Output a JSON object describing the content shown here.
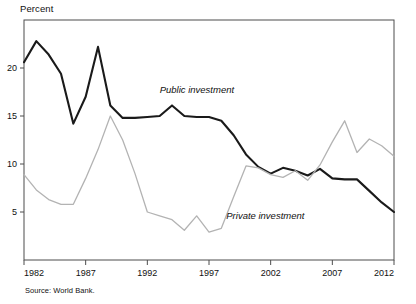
{
  "figure": {
    "y_axis_title": "Percent",
    "source": "Source: World Bank.",
    "label_public": "Public investment",
    "label_private": "Private investment",
    "color_public": "#1a1a1a",
    "color_private": "#b3b3b3",
    "frame_color": "#4d4d4d"
  },
  "chart_data": {
    "type": "line",
    "title": "",
    "xlabel": "",
    "ylabel": "Percent",
    "xlim": [
      1982,
      2012
    ],
    "ylim": [
      0,
      25
    ],
    "xticks": [
      1982,
      1987,
      1992,
      1997,
      2002,
      2007,
      2012
    ],
    "yticks": [
      5,
      10,
      15,
      20
    ],
    "ytick_labels": [
      "5",
      "10",
      "15",
      "20"
    ],
    "xtick_labels": [
      "1982",
      "1987",
      "1992",
      "1997",
      "2002",
      "2007",
      "2012"
    ],
    "grid": false,
    "legend": "inline-annotations",
    "annotations": [
      {
        "text": "Public investment",
        "x": 1993.0,
        "y": 17.4
      },
      {
        "text": "Private investment",
        "x": 1998.4,
        "y": 4.3
      }
    ],
    "x": [
      1982,
      1983,
      1984,
      1985,
      1986,
      1987,
      1988,
      1989,
      1990,
      1991,
      1992,
      1993,
      1994,
      1995,
      1996,
      1997,
      1998,
      1999,
      2000,
      2001,
      2002,
      2003,
      2004,
      2005,
      2006,
      2007,
      2008,
      2009,
      2010,
      2011,
      2012
    ],
    "series": [
      {
        "name": "Public investment",
        "color": "#1a1a1a",
        "values": [
          20.6,
          22.8,
          21.4,
          19.4,
          14.2,
          17.0,
          22.2,
          16.1,
          14.8,
          14.8,
          14.9,
          15.0,
          16.1,
          15.0,
          14.9,
          14.9,
          14.5,
          13.0,
          11.0,
          9.7,
          9.0,
          9.6,
          9.3,
          8.8,
          9.5,
          8.5,
          8.4,
          8.4,
          7.2,
          6.0,
          5.0
        ]
      },
      {
        "name": "Private investment",
        "color": "#b3b3b3",
        "values": [
          8.9,
          7.3,
          6.3,
          5.8,
          5.8,
          8.5,
          11.5,
          15.0,
          12.5,
          9.0,
          5.0,
          4.6,
          4.2,
          3.1,
          4.6,
          2.9,
          3.3,
          6.6,
          9.8,
          9.6,
          8.9,
          8.6,
          9.3,
          8.3,
          9.9,
          12.3,
          14.5,
          11.2,
          12.6,
          11.9,
          10.8
        ]
      }
    ]
  }
}
